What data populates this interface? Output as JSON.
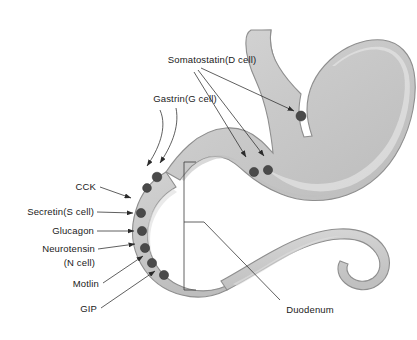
{
  "figure": {
    "background_color": "#ffffff",
    "width": 417,
    "height": 340
  },
  "colors": {
    "organ_fill": "#c9c9c9",
    "organ_fill_light": "#d7d7d7",
    "organ_highlight": "#e2e2e2",
    "organ_shadow": "#b4b4b4",
    "organ_outline": "#8e8e8e",
    "cell_dot": "#4a4a4a",
    "leader_line": "#2b2b2b",
    "label_text": "#1a1a1a"
  },
  "labels": {
    "somatostatin": "Somatostatin(D cell)",
    "gastrin": "Gastrin(G cell)",
    "cck": "CCK",
    "secretin": "Secretin(S cell)",
    "glucagon": "Glucagon",
    "neurotensin_line1": "Neurotensin",
    "neurotensin_line2": "(N cell)",
    "motlin": "Motlin",
    "gip": "GIP",
    "duodenum": "Duodenum"
  },
  "anatomy": {
    "stomach": "stomach",
    "esophagus": "esophagus",
    "duodenum": "duodenum",
    "jejunum": "jejunum"
  },
  "cell_markers": {
    "stomach_body": [
      {
        "cx": 301,
        "cy": 116,
        "r": 5.0
      },
      {
        "cx": 254,
        "cy": 172,
        "r": 4.6
      },
      {
        "cx": 268,
        "cy": 170,
        "r": 4.6
      }
    ],
    "duodenum_curve": [
      {
        "cx": 157,
        "cy": 177,
        "r": 4.8
      },
      {
        "cx": 147,
        "cy": 187,
        "r": 4.4
      },
      {
        "cx": 141,
        "cy": 213,
        "r": 4.6
      },
      {
        "cx": 142,
        "cy": 231,
        "r": 4.6
      },
      {
        "cx": 145,
        "cy": 248,
        "r": 4.6
      },
      {
        "cx": 151,
        "cy": 263,
        "r": 4.6
      },
      {
        "cx": 162,
        "cy": 275,
        "r": 4.6
      }
    ]
  }
}
